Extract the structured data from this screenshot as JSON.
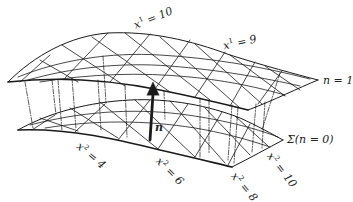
{
  "diagram": {
    "title": "",
    "surfaces": [
      {
        "id": "upper",
        "label": "n = 1"
      },
      {
        "id": "lower",
        "label": "Σ(n = 0)"
      }
    ],
    "vector": {
      "label": "n"
    },
    "coordinate_labels": {
      "x1": [
        {
          "var": "x",
          "sup": "1",
          "eq": " = 10"
        },
        {
          "var": "x",
          "sup": "1",
          "eq": " = 9"
        }
      ],
      "x2": [
        {
          "var": "x",
          "sup": "2",
          "eq": " = 4"
        },
        {
          "var": "x",
          "sup": "2",
          "eq": " = 6"
        },
        {
          "var": "x",
          "sup": "2",
          "eq": " = 8"
        },
        {
          "var": "x",
          "sup": "2",
          "eq": " = 10"
        }
      ]
    },
    "colors": {
      "ink": "#1a1a1a",
      "background": "#ffffff"
    }
  }
}
